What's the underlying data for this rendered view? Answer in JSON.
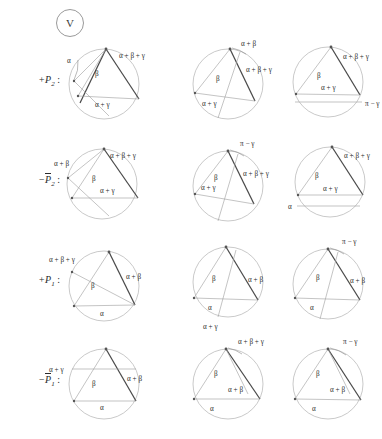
{
  "badge": {
    "text": "V"
  },
  "rows": [
    {
      "label_sign": "+",
      "label_base": "P",
      "label_sub": "2",
      "label_overline": false,
      "label_colon": ":",
      "cells": [
        {
          "labels": [
            "α",
            "β",
            "α + β + γ",
            "α + γ"
          ]
        },
        {
          "labels": [
            "α + β",
            "β",
            "α + β + γ",
            "α + γ"
          ]
        },
        {
          "labels": [
            "α + β + γ",
            "β",
            "α + γ",
            "π − γ"
          ]
        }
      ]
    },
    {
      "label_sign": "−",
      "label_base": "P",
      "label_sub": "2",
      "label_overline": true,
      "label_colon": ":",
      "cells": [
        {
          "labels": [
            "α + β",
            "α + β + γ",
            "β",
            "α + γ"
          ]
        },
        {
          "labels": [
            "π − γ",
            "β",
            "α + β + γ",
            "α + γ"
          ]
        },
        {
          "labels": [
            "α + β + γ",
            "β",
            "α + γ",
            "α"
          ]
        }
      ]
    },
    {
      "label_sign": "+",
      "label_base": "P",
      "label_sub": "1",
      "label_overline": false,
      "label_colon": ":",
      "cells": [
        {
          "labels": [
            "α + β + γ",
            "β",
            "α + β",
            "α"
          ]
        },
        {
          "labels": [
            "β",
            "α + β",
            "α",
            "α + γ"
          ]
        },
        {
          "labels": [
            "π − γ",
            "β",
            "α + β",
            "α"
          ]
        }
      ]
    },
    {
      "label_sign": "−",
      "label_base": "P",
      "label_sub": "1",
      "label_overline": true,
      "label_colon": ":",
      "cells": [
        {
          "labels": [
            "α + γ",
            "β",
            "α + β",
            "α"
          ]
        },
        {
          "labels": [
            "α + β + γ",
            "β",
            "α + β",
            "α"
          ]
        },
        {
          "labels": [
            "π − γ",
            "β",
            "α + β",
            "α"
          ]
        }
      ]
    }
  ],
  "colors": {
    "circle_stroke": "#b2b2b2",
    "chord_stroke": "#9c9c9c",
    "triangle_stroke": "#4a4a4a",
    "text": "#2b2b2b",
    "background": "#ffffff"
  }
}
